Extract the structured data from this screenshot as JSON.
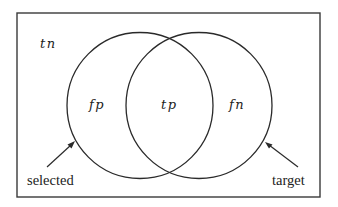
{
  "diagram": {
    "type": "venn",
    "universe": {
      "label": "tn"
    },
    "sets": [
      {
        "name": "selected",
        "callout": "selected"
      },
      {
        "name": "target",
        "callout": "target"
      }
    ],
    "regions": {
      "selected_only": "fp",
      "intersection": "tp",
      "target_only": "fn",
      "outside": "tn"
    },
    "colors": {
      "stroke": "#2a2a2a",
      "text": "#222222",
      "background": "#ffffff"
    }
  }
}
